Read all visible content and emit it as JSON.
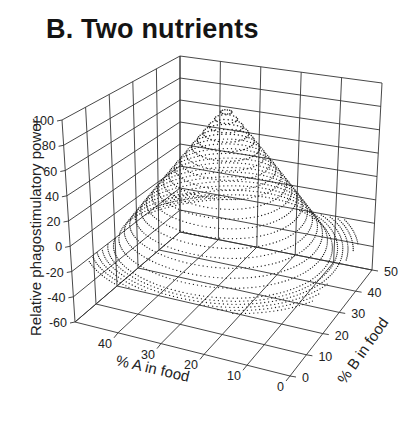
{
  "title": "B. Two nutrients",
  "chart_data": {
    "type": "scatter3d",
    "title": "B. Two nutrients",
    "xlabel": "% A in food",
    "ylabel": "% B in food",
    "zlabel": "Relative phagostimulatory power",
    "x_ticks": [
      0,
      10,
      20,
      30,
      40
    ],
    "y_ticks": [
      0,
      10,
      20,
      30,
      40,
      50
    ],
    "z_ticks": [
      100,
      80,
      60,
      40,
      20,
      0,
      -20,
      -40,
      -60
    ],
    "xlim": [
      0,
      50
    ],
    "ylim": [
      0,
      50
    ],
    "zlim": [
      -60,
      100
    ],
    "grid": true,
    "surface": {
      "shape": "cone-shaped peak rendered as concentric dotted rings",
      "peak": {
        "A": 27,
        "B": 27,
        "z": 100
      },
      "base_radius_at_z0": 20,
      "min_z": -20
    }
  },
  "colors": {
    "ink": "#222222",
    "grid": "#333333",
    "background": "#ffffff"
  }
}
